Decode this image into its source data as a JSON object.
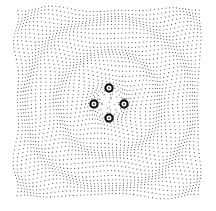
{
  "figure": {
    "width": 216,
    "height": 211,
    "background": "#ffffff",
    "lattice": {
      "x0": 16,
      "y0": 9,
      "x1": 200,
      "y1": 197,
      "spacing": 3.6,
      "dot_radius": 0.55,
      "dot_color": "#444444",
      "center": [
        109,
        103
      ],
      "ring_wavelength": 34,
      "ring_amplitude": 2.2,
      "swirl_strength": 0.35
    },
    "markers": [
      {
        "id": "top",
        "cx": 109,
        "cy": 88
      },
      {
        "id": "left",
        "cx": 94,
        "cy": 104
      },
      {
        "id": "right",
        "cx": 124,
        "cy": 104
      },
      {
        "id": "bottom",
        "cx": 109,
        "cy": 118
      }
    ],
    "marker_style": {
      "outer_radius": 3.6,
      "stroke_width": 2.2,
      "stroke_color": "#111111",
      "fill": "#ffffff",
      "inner_dot_radius": 0.9,
      "inner_dot_color": "#333333"
    }
  }
}
